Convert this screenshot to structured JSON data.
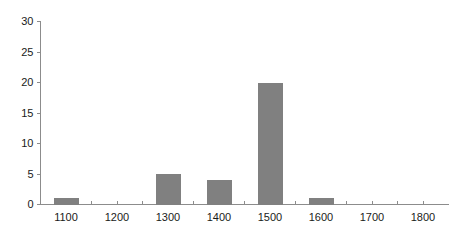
{
  "chart_data": {
    "type": "bar",
    "title": "",
    "subtitle": "",
    "xlabel": "",
    "ylabel": "",
    "categories": [
      1100,
      1300,
      1400,
      1500,
      1600
    ],
    "values": [
      1,
      5,
      4,
      20,
      1
    ],
    "xlim": [
      1050,
      1850
    ],
    "ylim": [
      0,
      30
    ],
    "x_ticks": [
      1100,
      1200,
      1300,
      1400,
      1500,
      1600,
      1700,
      1800
    ],
    "x_tick_labels": [
      "1100",
      "1200",
      "1300",
      "1400",
      "1500",
      "1600",
      "1700",
      "1800"
    ],
    "x_minor_ticks": [
      1150,
      1250,
      1350,
      1450,
      1550,
      1650,
      1750
    ],
    "y_ticks": [
      0,
      5,
      10,
      15,
      20,
      25,
      30
    ],
    "y_tick_labels": [
      "0",
      "5",
      "10",
      "15",
      "20",
      "25",
      "30"
    ],
    "grid": false,
    "legend": null,
    "bar_width": 25,
    "bar_color": "#808080",
    "axis_color": "#8c8c8c",
    "text_color": "#1a1a1a",
    "background_color": "#ffffff",
    "annotations": []
  }
}
